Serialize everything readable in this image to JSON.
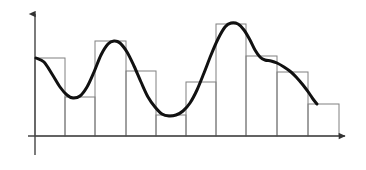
{
  "figure": {
    "title": "",
    "background_color": "#ffffff",
    "width": 366,
    "height": 170,
    "axis_color": "#4a4a4a",
    "bar_edge_color": "#808080",
    "bar_fill_color": "none",
    "curve_color": "#111111",
    "curve_width": 3.0,
    "bar_edge_width": 1.0,
    "axis_width": 1.4
  },
  "axes": {
    "y_axis": {
      "name": "y-axis",
      "x": 35,
      "y_top": 14,
      "y_bottom": 155,
      "arrow": "up",
      "label": ""
    },
    "x_axis": {
      "name": "x-axis",
      "y": 136,
      "x_left": 28,
      "x_right": 345,
      "arrow": "right",
      "label": ""
    }
  },
  "chart_data": {
    "type": "bar",
    "title": "",
    "subtitle": "",
    "xlabel": "",
    "ylabel": "",
    "grid": false,
    "legend": null,
    "legend_position": "none",
    "xlim": [
      0,
      10
    ],
    "ylim": [
      0,
      1.0
    ],
    "bin_edges": [
      0,
      1,
      2,
      3,
      4,
      5,
      6,
      7,
      8,
      9,
      10
    ],
    "categories": [
      "1",
      "2",
      "3",
      "4",
      "5",
      "6",
      "7",
      "8",
      "9",
      "10"
    ],
    "values": [
      0.64,
      0.32,
      0.78,
      0.53,
      0.17,
      0.44,
      0.92,
      0.66,
      0.53,
      0.26
    ],
    "tick_labels_x": [],
    "tick_labels_y": [],
    "annotations": [],
    "overlay": {
      "type": "line",
      "name": "density-curve",
      "style": "smooth",
      "color": "#111111",
      "x": [
        0.0,
        0.5,
        1.0,
        1.5,
        2.0,
        2.5,
        3.0,
        3.5,
        4.0,
        4.5,
        5.0,
        5.5,
        6.0,
        6.5,
        7.0,
        7.5,
        8.0,
        8.5,
        9.0,
        9.5
      ],
      "y": [
        0.64,
        0.53,
        0.32,
        0.3,
        0.5,
        0.78,
        0.74,
        0.53,
        0.3,
        0.17,
        0.19,
        0.44,
        0.68,
        0.92,
        0.92,
        0.66,
        0.62,
        0.53,
        0.4,
        0.26
      ]
    }
  },
  "bars": [
    {
      "name": "histogram-bar-1",
      "index": 1,
      "x0": 35,
      "x1": 65,
      "top_y": 58,
      "value": 0.64
    },
    {
      "name": "histogram-bar-2",
      "index": 2,
      "x0": 65,
      "x1": 95,
      "top_y": 97,
      "value": 0.32
    },
    {
      "name": "histogram-bar-3",
      "index": 3,
      "x0": 95,
      "x1": 126,
      "top_y": 41,
      "value": 0.78
    },
    {
      "name": "histogram-bar-4",
      "index": 4,
      "x0": 126,
      "x1": 156,
      "top_y": 71,
      "value": 0.53
    },
    {
      "name": "histogram-bar-5",
      "index": 5,
      "x0": 156,
      "x1": 186,
      "top_y": 115,
      "value": 0.17
    },
    {
      "name": "histogram-bar-6",
      "index": 6,
      "x0": 186,
      "x1": 216,
      "top_y": 82,
      "value": 0.44
    },
    {
      "name": "histogram-bar-7",
      "index": 7,
      "x0": 216,
      "x1": 246,
      "top_y": 24,
      "value": 0.92
    },
    {
      "name": "histogram-bar-8",
      "index": 8,
      "x0": 246,
      "x1": 277,
      "top_y": 56,
      "value": 0.66
    },
    {
      "name": "histogram-bar-9",
      "index": 9,
      "x0": 277,
      "x1": 308,
      "top_y": 72,
      "value": 0.53
    },
    {
      "name": "histogram-bar-10",
      "index": 10,
      "x0": 308,
      "x1": 339,
      "top_y": 104,
      "value": 0.26
    }
  ],
  "curve_points_px": [
    [
      36,
      58
    ],
    [
      44,
      62
    ],
    [
      52,
      74
    ],
    [
      60,
      87
    ],
    [
      67,
      95
    ],
    [
      73,
      98
    ],
    [
      80,
      96
    ],
    [
      87,
      87
    ],
    [
      94,
      72
    ],
    [
      101,
      55
    ],
    [
      108,
      44
    ],
    [
      114,
      41
    ],
    [
      120,
      43
    ],
    [
      127,
      52
    ],
    [
      134,
      66
    ],
    [
      141,
      82
    ],
    [
      148,
      97
    ],
    [
      155,
      107
    ],
    [
      162,
      114
    ],
    [
      169,
      116
    ],
    [
      176,
      115
    ],
    [
      183,
      111
    ],
    [
      190,
      103
    ],
    [
      197,
      90
    ],
    [
      204,
      73
    ],
    [
      211,
      55
    ],
    [
      218,
      39
    ],
    [
      225,
      27
    ],
    [
      231,
      23
    ],
    [
      238,
      24
    ],
    [
      244,
      30
    ],
    [
      250,
      40
    ],
    [
      255,
      50
    ],
    [
      260,
      57
    ],
    [
      265,
      60
    ],
    [
      271,
      61
    ],
    [
      277,
      63
    ],
    [
      284,
      67
    ],
    [
      291,
      72
    ],
    [
      297,
      78
    ],
    [
      303,
      85
    ],
    [
      309,
      93
    ],
    [
      313,
      99
    ],
    [
      317,
      104
    ]
  ]
}
